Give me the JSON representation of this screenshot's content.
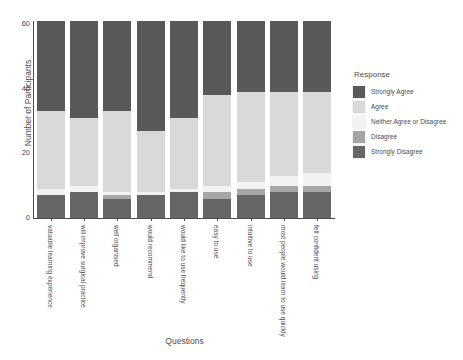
{
  "chart_data": {
    "type": "bar",
    "stacked": true,
    "title": "",
    "xlabel": "Questions",
    "ylabel": "Number of Participants",
    "ylim": [
      0,
      61
    ],
    "yticks": [
      0,
      20,
      40,
      60
    ],
    "grid": false,
    "legend": {
      "title": "Response",
      "position": "right"
    },
    "categories": [
      "valuable learning experience",
      "will improve surgical practice",
      "well organised",
      "would recommend",
      "would like to use frequently",
      "easy to use",
      "intuitive to use",
      "most people would learn to use quickly",
      "felt confident using"
    ],
    "series": [
      {
        "name": "Strongly Agree",
        "color": "#595959",
        "values": [
          28,
          30,
          28,
          34,
          30,
          23,
          22,
          22,
          22
        ]
      },
      {
        "name": "Agree",
        "color": "#d9d9d9",
        "values": [
          24,
          21,
          25,
          19,
          22,
          28,
          28,
          26,
          25
        ]
      },
      {
        "name": "Neither Agree or Disagree",
        "color": "#f2f2f2",
        "values": [
          2,
          2,
          1,
          1,
          1,
          2,
          2,
          3,
          4
        ]
      },
      {
        "name": "Disagree",
        "color": "#a6a6a6",
        "values": [
          0,
          0,
          1,
          0,
          0,
          2,
          2,
          2,
          2
        ]
      },
      {
        "name": "Strongly Disagree",
        "color": "#666666",
        "values": [
          7,
          8,
          6,
          7,
          8,
          6,
          7,
          8,
          8
        ]
      }
    ]
  }
}
